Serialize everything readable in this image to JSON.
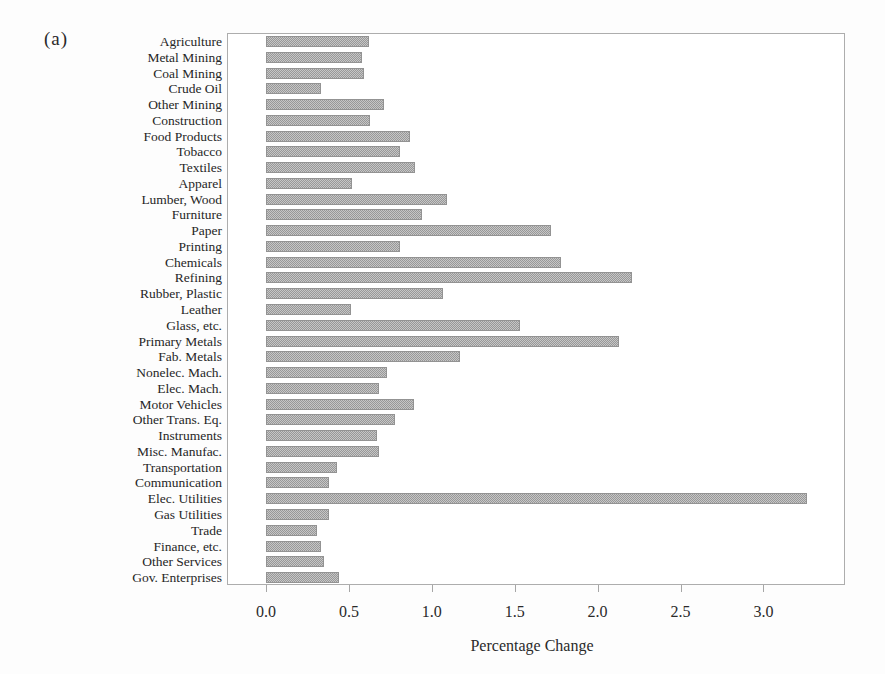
{
  "figure_label": "(a)",
  "chart_data": {
    "type": "bar",
    "orientation": "horizontal",
    "title": "",
    "xlabel": "Percentage Change",
    "ylabel": "",
    "xlim": [
      0.0,
      3.5
    ],
    "x_ticks": [
      0.0,
      0.5,
      1.0,
      1.5,
      2.0,
      2.5,
      3.0
    ],
    "grid": false,
    "legend": "none",
    "bar_fill_style": "gray-halftone-hatch",
    "bar_color": "#b0b0b0",
    "bar_edge_color": "#939393",
    "frame_color": "#adadad",
    "categories": [
      "Agriculture",
      "Metal Mining",
      "Coal Mining",
      "Crude Oil",
      "Other Mining",
      "Construction",
      "Food Products",
      "Tobacco",
      "Textiles",
      "Apparel",
      "Lumber, Wood",
      "Furniture",
      "Paper",
      "Printing",
      "Chemicals",
      "Refining",
      "Rubber, Plastic",
      "Leather",
      "Glass, etc.",
      "Primary Metals",
      "Fab. Metals",
      "Nonelec. Mach.",
      "Elec. Mach.",
      "Motor Vehicles",
      "Other Trans. Eq.",
      "Instruments",
      "Misc. Manufac.",
      "Transportation",
      "Communication",
      "Elec. Utilities",
      "Gas Utilities",
      "Trade",
      "Finance, etc.",
      "Other Services",
      "Gov. Enterprises"
    ],
    "values": [
      0.62,
      0.58,
      0.59,
      0.33,
      0.71,
      0.63,
      0.87,
      0.81,
      0.9,
      0.52,
      1.09,
      0.94,
      1.72,
      0.81,
      1.78,
      2.21,
      1.07,
      0.51,
      1.53,
      2.13,
      1.17,
      0.73,
      0.68,
      0.89,
      0.78,
      0.67,
      0.68,
      0.43,
      0.38,
      3.26,
      0.38,
      0.31,
      0.33,
      0.35,
      0.44
    ]
  }
}
